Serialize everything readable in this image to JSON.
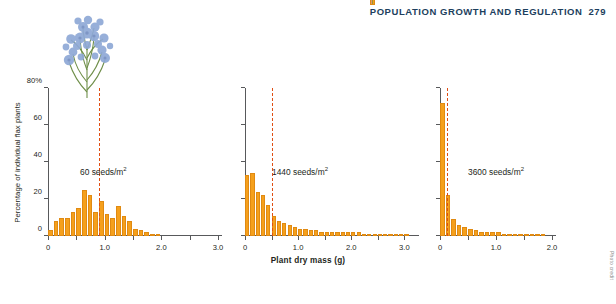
{
  "header": {
    "running_head": "POPULATION GROWTH AND REGULATION",
    "separator": "|",
    "page_number": "279"
  },
  "figure": {
    "flower_icon": "flax-plant-photo",
    "credit": "Photo credit"
  },
  "chart_data": {
    "type": "bar",
    "title": "",
    "xlabel": "Plant dry mass (g)",
    "ylabel": "Percentage of individual flax plants",
    "ylim": [
      0,
      80
    ],
    "yticks": [
      0,
      20,
      40,
      60,
      80
    ],
    "ytick_labels": [
      "0",
      "20",
      "40",
      "60",
      "80%"
    ],
    "grid": false,
    "legend": "none",
    "panels": [
      {
        "label": "60 seeds/m",
        "label_sup": "2",
        "xlim": [
          0,
          3.0
        ],
        "xticks": [
          0,
          0.5,
          1.0,
          1.5,
          2.0,
          2.5,
          3.0
        ],
        "xtick_labels": [
          "0",
          "",
          "1.0",
          "",
          "2.0",
          "",
          "3.0"
        ],
        "mean_line_x": 0.9,
        "bin_width": 0.1,
        "x": [
          0.05,
          0.15,
          0.25,
          0.35,
          0.45,
          0.55,
          0.65,
          0.75,
          0.85,
          0.95,
          1.05,
          1.15,
          1.25,
          1.35,
          1.45,
          1.55,
          1.65,
          1.75,
          1.85,
          1.95
        ],
        "values": [
          3,
          8,
          10,
          10,
          13,
          15,
          25,
          22,
          13,
          19,
          12,
          10,
          16,
          11,
          8,
          4,
          3,
          2,
          1,
          1
        ]
      },
      {
        "label": "1440 seeds/m",
        "label_sup": "2",
        "xlim": [
          0,
          3.2
        ],
        "xticks": [
          0,
          0.5,
          1.0,
          1.5,
          2.0,
          2.5,
          3.0
        ],
        "xtick_labels": [
          "0",
          "",
          "1.0",
          "",
          "2.0",
          "",
          "3.0"
        ],
        "mean_line_x": 0.5,
        "bin_width": 0.1,
        "x": [
          0.05,
          0.15,
          0.25,
          0.35,
          0.45,
          0.55,
          0.65,
          0.75,
          0.85,
          0.95,
          1.05,
          1.15,
          1.25,
          1.35,
          1.45,
          1.55,
          1.65,
          1.75,
          1.85,
          1.95,
          2.05,
          2.15,
          2.25,
          2.35,
          2.45,
          2.55,
          2.65,
          2.75,
          2.85,
          2.95,
          3.05
        ],
        "values": [
          33,
          34,
          24,
          22,
          17,
          11,
          8,
          7,
          6,
          5,
          4,
          4,
          3,
          3,
          2,
          2,
          2,
          2,
          2,
          2,
          2,
          2,
          1,
          1,
          1,
          1,
          1,
          1,
          1,
          1,
          1
        ]
      },
      {
        "label": "3600 seeds/m",
        "label_sup": "2",
        "xlim": [
          0,
          2.0
        ],
        "xticks": [
          0,
          0.5,
          1.0,
          1.5,
          2.0
        ],
        "xtick_labels": [
          "0",
          "",
          "1.0",
          "",
          "2.0"
        ],
        "mean_line_x": 0.12,
        "bin_width": 0.1,
        "x": [
          0.05,
          0.15,
          0.25,
          0.35,
          0.45,
          0.55,
          0.65,
          0.75,
          0.85,
          0.95,
          1.05,
          1.15,
          1.25,
          1.35,
          1.45,
          1.55,
          1.65,
          1.75,
          1.85
        ],
        "values": [
          72,
          22,
          9,
          6,
          5,
          4,
          3,
          2,
          2,
          2,
          2,
          1,
          1,
          1,
          1,
          1,
          1,
          1,
          1
        ]
      }
    ]
  }
}
